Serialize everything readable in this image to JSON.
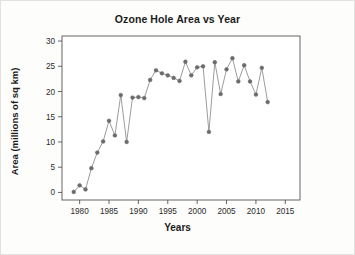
{
  "figure": {
    "title": "Ozone Hole Area vs Year",
    "x_axis_label": "Years",
    "y_axis_label": "Area (millions of sq km)",
    "marker_color": "#6b6b6b",
    "line_color": "#8a8a8a",
    "axis_color": "#4a4a4a",
    "background_color": "#ffffff"
  },
  "chart_data": {
    "type": "line",
    "title": "Ozone Hole Area vs Year",
    "xlabel": "Years",
    "ylabel": "Area (millions of sq km)",
    "xlim": [
      1977,
      2017.5
    ],
    "ylim": [
      -1.5,
      31
    ],
    "grid": false,
    "legend": null,
    "xticks": [
      1980,
      1985,
      1990,
      1995,
      2000,
      2005,
      2010,
      2015
    ],
    "yticks": [
      0,
      5,
      10,
      15,
      20,
      25,
      30
    ],
    "xtick_labels": [
      "1980",
      "1985",
      "1990",
      "1995",
      "2000",
      "2005",
      "2010",
      "2015"
    ],
    "ytick_labels": [
      "0",
      "5",
      "10",
      "15",
      "20",
      "25",
      "30"
    ],
    "x": [
      1979,
      1980,
      1981,
      1982,
      1983,
      1984,
      1985,
      1986,
      1987,
      1988,
      1989,
      1990,
      1991,
      1992,
      1993,
      1994,
      1995,
      1996,
      1997,
      1998,
      1999,
      2000,
      2001,
      2002,
      2003,
      2004,
      2005,
      2006,
      2007,
      2008,
      2009,
      2010,
      2011,
      2012
    ],
    "y": [
      0.1,
      1.4,
      0.6,
      4.8,
      7.9,
      10.1,
      14.2,
      11.3,
      19.3,
      10.0,
      18.8,
      18.9,
      18.7,
      22.3,
      24.2,
      23.6,
      23.2,
      22.7,
      22.1,
      25.9,
      23.2,
      24.8,
      25.0,
      12.0,
      25.8,
      19.5,
      24.4,
      26.6,
      22.0,
      25.2,
      22.0,
      19.4,
      24.7,
      17.9
    ],
    "series": [
      {
        "name": "Ozone hole area",
        "marker": "circle",
        "line_style": "solid",
        "values": [
          0.1,
          1.4,
          0.6,
          4.8,
          7.9,
          10.1,
          14.2,
          11.3,
          19.3,
          10.0,
          18.8,
          18.9,
          18.7,
          22.3,
          24.2,
          23.6,
          23.2,
          22.7,
          22.1,
          25.9,
          23.2,
          24.8,
          25.0,
          12.0,
          25.8,
          19.5,
          24.4,
          26.6,
          22.0,
          25.2,
          22.0,
          19.4,
          24.7,
          17.9
        ]
      }
    ]
  }
}
